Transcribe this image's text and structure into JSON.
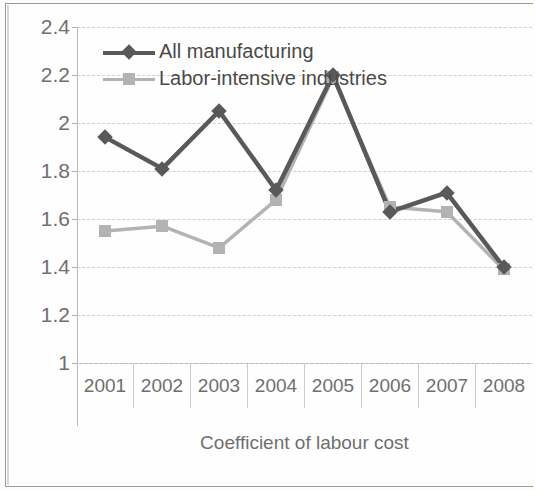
{
  "chart_data": {
    "type": "line",
    "title": "",
    "xlabel": "Coefficient of labour cost",
    "ylabel": "",
    "categories": [
      "2001",
      "2002",
      "2003",
      "2004",
      "2005",
      "2006",
      "2007",
      "2008"
    ],
    "ylim": [
      1,
      2.4
    ],
    "ytick_labels": [
      "2.4",
      "2.2",
      "2",
      "1.8",
      "1.6",
      "1.4",
      "1.2",
      "1"
    ],
    "ytick_values": [
      2.4,
      2.2,
      2.0,
      1.8,
      1.6,
      1.4,
      1.2,
      1.0
    ],
    "grid": true,
    "legend_position": "top-left-inside",
    "series": [
      {
        "name": "All manufacturing",
        "color": "#595959",
        "marker": "diamond",
        "values": [
          1.94,
          1.81,
          2.05,
          1.72,
          2.2,
          1.63,
          1.71,
          1.4
        ]
      },
      {
        "name": "Labor-intensive industries",
        "color": "#b3b3b3",
        "marker": "square",
        "values": [
          1.55,
          1.57,
          1.48,
          1.68,
          2.19,
          1.65,
          1.63,
          1.39
        ]
      }
    ]
  },
  "axis": {
    "x_title": "Coefficient of labour cost"
  },
  "legend": {
    "items": [
      {
        "label": "All manufacturing"
      },
      {
        "label": "Labor-intensive industries"
      }
    ]
  }
}
